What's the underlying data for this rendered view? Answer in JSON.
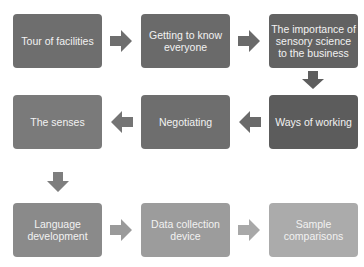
{
  "diagram": {
    "steps": [
      {
        "label": "Tour of facilities",
        "color": "#6e6e6e"
      },
      {
        "label": "Getting to know everyone",
        "color": "#6a6a6a"
      },
      {
        "label": "The importance of sensory science to the business",
        "color": "#626262"
      },
      {
        "label": "Ways of working",
        "color": "#5c5c5c"
      },
      {
        "label": "Negotiating",
        "color": "#6e6e6e"
      },
      {
        "label": "The senses",
        "color": "#7a7a7a"
      },
      {
        "label": "Language development",
        "color": "#8a8a8a"
      },
      {
        "label": "Data collection device",
        "color": "#9c9c9c"
      },
      {
        "label": "Sample comparisons",
        "color": "#ababab"
      }
    ],
    "arrows": [
      {
        "from": 1,
        "to": 2,
        "direction": "right"
      },
      {
        "from": 2,
        "to": 3,
        "direction": "right"
      },
      {
        "from": 3,
        "to": 4,
        "direction": "down"
      },
      {
        "from": 4,
        "to": 5,
        "direction": "left"
      },
      {
        "from": 5,
        "to": 6,
        "direction": "left"
      },
      {
        "from": 6,
        "to": 7,
        "direction": "down"
      },
      {
        "from": 7,
        "to": 8,
        "direction": "right"
      },
      {
        "from": 8,
        "to": 9,
        "direction": "right"
      }
    ]
  }
}
